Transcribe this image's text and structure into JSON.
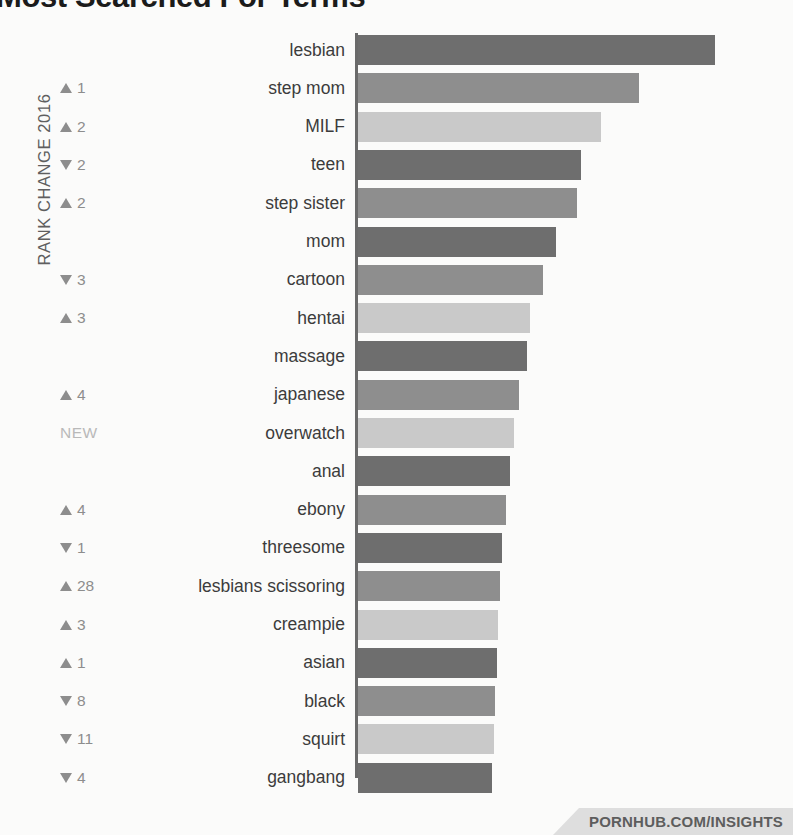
{
  "title": {
    "main": "Most Searched For Terms",
    "clipped": true
  },
  "axis_caption": "RANK CHANGE 2016",
  "footer": {
    "label": "PORNHUB.COM/INSIGHTS"
  },
  "colors": {
    "bar_dark": "#6e6e6e",
    "bar_medium": "#8e8e8e",
    "bar_light": "#c9c9c9",
    "background": "#fbfbfa",
    "label_text": "#3c3c3c",
    "rank_text": "#8d8d8d",
    "new_text": "#b9b9b9",
    "axis_line": "#6a6a6a",
    "footer_bg": "#dedede",
    "footer_text": "#5d5d5d"
  },
  "chart_data": {
    "type": "bar",
    "orientation": "horizontal",
    "title": "Most Searched For Terms",
    "xlabel": "",
    "ylabel": "RANK CHANGE 2016",
    "grid": false,
    "legend": null,
    "categories": [
      "lesbian",
      "step mom",
      "MILF",
      "teen",
      "step sister",
      "mom",
      "cartoon",
      "hentai",
      "massage",
      "japanese",
      "overwatch",
      "anal",
      "ebony",
      "threesome",
      "lesbians scissoring",
      "creampie",
      "asian",
      "black",
      "squirt",
      "gangbang"
    ],
    "values": [
      357,
      281,
      243,
      223,
      219,
      198,
      185,
      172,
      169,
      161,
      156,
      152,
      148,
      144,
      142,
      140,
      139,
      137,
      136,
      134
    ],
    "value_unit": "relative search volume (px length)",
    "bar_colors": [
      "#6e6e6e",
      "#8e8e8e",
      "#c9c9c9",
      "#6e6e6e",
      "#8e8e8e",
      "#6e6e6e",
      "#8e8e8e",
      "#c9c9c9",
      "#6e6e6e",
      "#8e8e8e",
      "#c9c9c9",
      "#6e6e6e",
      "#8e8e8e",
      "#6e6e6e",
      "#8e8e8e",
      "#c9c9c9",
      "#6e6e6e",
      "#8e8e8e",
      "#c9c9c9",
      "#6e6e6e"
    ],
    "rank_change": [
      {
        "dir": "none",
        "value": ""
      },
      {
        "dir": "up",
        "value": "1"
      },
      {
        "dir": "up",
        "value": "2"
      },
      {
        "dir": "down",
        "value": "2"
      },
      {
        "dir": "up",
        "value": "2"
      },
      {
        "dir": "none",
        "value": ""
      },
      {
        "dir": "down",
        "value": "3"
      },
      {
        "dir": "up",
        "value": "3"
      },
      {
        "dir": "none",
        "value": ""
      },
      {
        "dir": "up",
        "value": "4"
      },
      {
        "dir": "new",
        "value": "NEW"
      },
      {
        "dir": "none",
        "value": ""
      },
      {
        "dir": "up",
        "value": "4"
      },
      {
        "dir": "down",
        "value": "1"
      },
      {
        "dir": "up",
        "value": "28"
      },
      {
        "dir": "up",
        "value": "3"
      },
      {
        "dir": "up",
        "value": "1"
      },
      {
        "dir": "down",
        "value": "8"
      },
      {
        "dir": "down",
        "value": "11"
      },
      {
        "dir": "down",
        "value": "4"
      }
    ]
  }
}
